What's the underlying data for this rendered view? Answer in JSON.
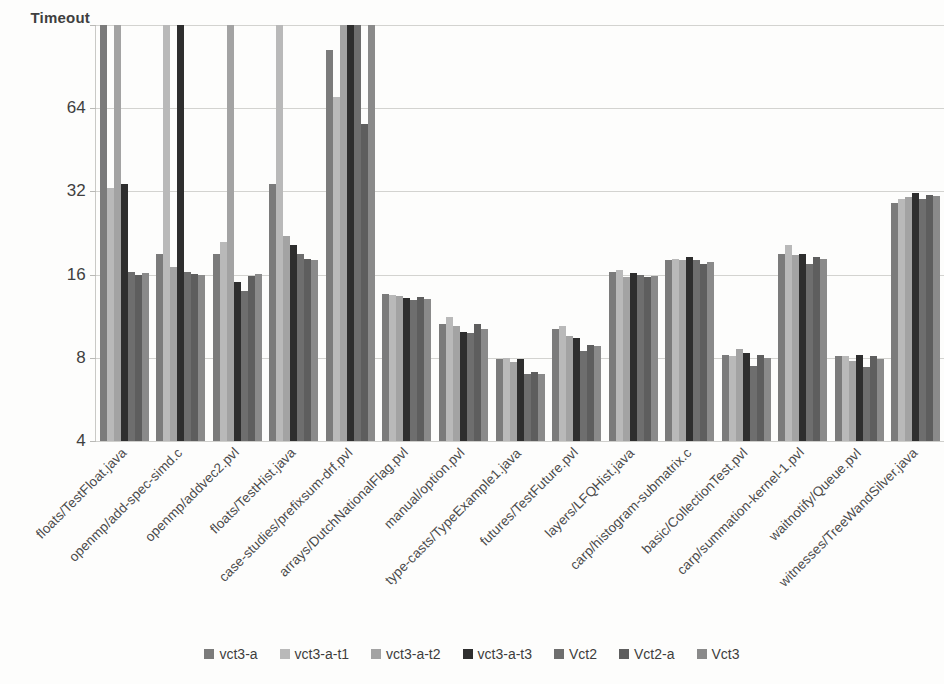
{
  "chart_data": {
    "type": "bar",
    "title": "",
    "xlabel": "",
    "ylabel": "",
    "yscale": "log2",
    "ylim": [
      4,
      128
    ],
    "grid": true,
    "legend_position": "bottom",
    "ytick_labels": [
      "4",
      "8",
      "16",
      "32",
      "64",
      "Timeout"
    ],
    "ytick_values": [
      4,
      8,
      16,
      32,
      64,
      128
    ],
    "timeout_label": "Timeout",
    "categories": [
      "floats/TestFloat.java",
      "openmp/add-spec-simd.c",
      "openmp/addvec2.pvl",
      "floats/TestHist.java",
      "case-studies/prefixsum-drf.pvl",
      "arrays/DutchNationalFlag.pvl",
      "manual/option.pvl",
      "type-casts/TypeExample1.java",
      "futures/TestFuture.pvl",
      "layers/LFQHist.java",
      "carp/histogram-submatrix.c",
      "basic/CollectionTest.pvl",
      "carp/summation-kernel-1.pvl",
      "waitnotify/Queue.pvl",
      "witnesses/TreeWandSilver.java"
    ],
    "series": [
      {
        "name": "vct3-a",
        "color": "#7b7b7b",
        "values": [
          128,
          19.0,
          19.0,
          34.0,
          104.0,
          13.6,
          10.6,
          7.9,
          10.2,
          16.4,
          18.0,
          8.2,
          19.0,
          8.1,
          29.0
        ]
      },
      {
        "name": "vct3-a-t1",
        "color": "#b9b9b9",
        "values": [
          33.0,
          128,
          21.0,
          128,
          70.0,
          13.5,
          11.2,
          8.0,
          10.4,
          16.6,
          18.2,
          8.1,
          20.5,
          8.1,
          30.0
        ]
      },
      {
        "name": "vct3-a-t2",
        "color": "#a3a3a3",
        "values": [
          128,
          17.0,
          128,
          22.0,
          128,
          13.4,
          10.4,
          7.7,
          9.6,
          15.7,
          18.0,
          8.6,
          18.8,
          7.8,
          30.5
        ]
      },
      {
        "name": "vct3-a-t3",
        "color": "#2e2e2e",
        "values": [
          34.0,
          128,
          15.0,
          20.5,
          128,
          13.2,
          9.9,
          7.9,
          9.4,
          16.2,
          18.6,
          8.3,
          19.0,
          8.2,
          31.5
        ]
      },
      {
        "name": "Vct2",
        "color": "#6e6e6e",
        "values": [
          16.4,
          16.4,
          14.0,
          19.0,
          128,
          13.0,
          9.8,
          7.0,
          8.5,
          15.9,
          18.0,
          7.5,
          17.5,
          7.4,
          30.0
        ]
      },
      {
        "name": "Vct2-a",
        "color": "#5e5e5e",
        "values": [
          16.0,
          16.1,
          15.8,
          18.2,
          56.0,
          13.3,
          10.6,
          7.1,
          8.9,
          15.7,
          17.5,
          8.2,
          18.6,
          8.1,
          31.0
        ]
      },
      {
        "name": "Vct3",
        "color": "#8a8a8a",
        "values": [
          16.2,
          16.0,
          16.1,
          18.0,
          128,
          13.1,
          10.2,
          7.0,
          8.8,
          15.8,
          17.8,
          8.0,
          18.2,
          7.9,
          30.8
        ]
      }
    ]
  },
  "legend": {
    "items": [
      {
        "label": "vct3-a",
        "color": "#7b7b7b"
      },
      {
        "label": "vct3-a-t1",
        "color": "#b9b9b9"
      },
      {
        "label": "vct3-a-t2",
        "color": "#a3a3a3"
      },
      {
        "label": "vct3-a-t3",
        "color": "#2e2e2e"
      },
      {
        "label": "Vct2",
        "color": "#6e6e6e"
      },
      {
        "label": "Vct2-a",
        "color": "#5e5e5e"
      },
      {
        "label": "Vct3",
        "color": "#8a8a8a"
      }
    ]
  },
  "axis": {
    "y_top_label": "Timeout",
    "ticks": [
      "Timeout",
      "64",
      "32",
      "16",
      "8",
      "4"
    ]
  }
}
